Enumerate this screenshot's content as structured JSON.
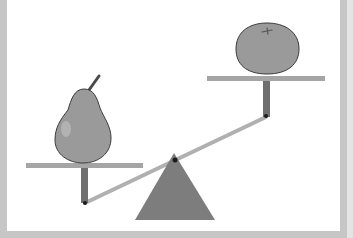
{
  "scene": {
    "title": "Balance scale comparing a pear and an orange",
    "description": "Seesaw-style balance with a triangular fulcrum; the pear side is lower, the orange side is higher.",
    "left_item": {
      "label": "pear",
      "side": "left",
      "position": "lower"
    },
    "right_item": {
      "label": "orange",
      "side": "right",
      "position": "higher"
    },
    "colors": {
      "background_frame": "#c6c6c6",
      "panel": "#ffffff",
      "fruit_fill": "#9a9a9a",
      "fruit_outline": "#3a3a3a",
      "platform": "#a5a5a5",
      "post": "#6f6f6f",
      "beam": "#b0b0b0",
      "fulcrum": "#7d7d7d",
      "pivot": "#1a1a1a"
    }
  }
}
